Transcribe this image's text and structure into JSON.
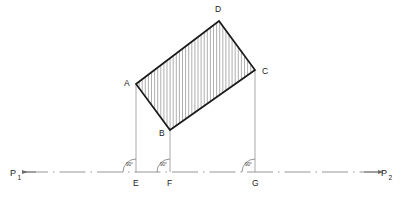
{
  "figure": {
    "colors": {
      "outline": "#1a1a1a",
      "hatch": "#8c8c8c",
      "projection_line": "#9a9a9a",
      "axis": "#8a8a8a",
      "arc": "#7a7a7a",
      "text": "#1a1a1a",
      "background": "#ffffff"
    }
  },
  "shape": {
    "name": "rectangle",
    "vertices": [
      {
        "label": "A",
        "x": 136,
        "y": 84,
        "label_x": 124,
        "label_y": 86
      },
      {
        "label": "D",
        "x": 219,
        "y": 21,
        "label_x": 215,
        "label_y": 12
      },
      {
        "label": "C",
        "x": 255,
        "y": 70,
        "label_x": 262,
        "label_y": 74
      },
      {
        "label": "B",
        "x": 170,
        "y": 130,
        "label_x": 159,
        "label_y": 136
      }
    ],
    "hatch": {
      "orientation": "vertical",
      "spacing_px": 3.1,
      "stroke_width": 0.7
    },
    "outline_stroke_width": 1.7
  },
  "projections": [
    {
      "name": "A-to-E",
      "from": "A",
      "to": "E",
      "x": 136,
      "y1": 84,
      "y2": 172
    },
    {
      "name": "B-to-F",
      "from": "B",
      "to": "F",
      "x": 170,
      "y1": 130,
      "y2": 172
    },
    {
      "name": "C-to-G",
      "from": "C",
      "to": "G",
      "x": 255,
      "y1": 70,
      "y2": 172
    }
  ],
  "axis": {
    "name": "reference-axis",
    "y": 172,
    "x_start": 22,
    "x_end": 378,
    "dash_pattern": "26 5 1.5 5",
    "left_endpoint": {
      "label": "P",
      "subscript": "1",
      "label_x": 10,
      "label_y": 176,
      "sub_x": 17.5,
      "sub_y": 180,
      "arrow_x": 22
    },
    "right_endpoint": {
      "label": "P",
      "subscript": "2",
      "label_x": 381,
      "label_y": 176,
      "sub_x": 388.5,
      "sub_y": 180,
      "arrow_x": 378
    }
  },
  "base_points": [
    {
      "label": "E",
      "x": 136,
      "label_x": 133,
      "label_y": 186
    },
    {
      "label": "F",
      "x": 170,
      "label_x": 167,
      "label_y": 186
    },
    {
      "label": "G",
      "x": 255,
      "label_x": 252,
      "label_y": 186
    }
  ],
  "angle_markers": [
    {
      "name": "angle-at-E",
      "at": "E",
      "x": 136,
      "y": 172,
      "radius": 13,
      "value": "90°",
      "label_x": 126,
      "label_y": 166
    },
    {
      "name": "angle-at-F",
      "at": "F",
      "x": 170,
      "y": 172,
      "radius": 13,
      "value": "90°",
      "label_x": 160,
      "label_y": 166
    },
    {
      "name": "angle-at-G",
      "at": "G",
      "x": 255,
      "y": 172,
      "radius": 13,
      "value": "90°",
      "label_x": 245,
      "label_y": 166
    }
  ]
}
